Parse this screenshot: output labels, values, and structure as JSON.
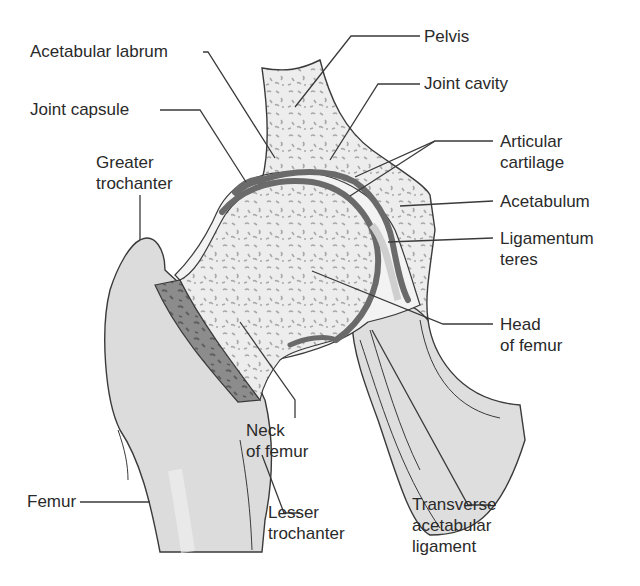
{
  "diagram": {
    "labels": {
      "acetabular_labrum": "Acetabular labrum",
      "joint_capsule": "Joint capsule",
      "greater_trochanter": [
        "Greater",
        "trochanter"
      ],
      "pelvis": "Pelvis",
      "joint_cavity": "Joint cavity",
      "articular_cartilage": [
        "Articular",
        "cartilage"
      ],
      "acetabulum": "Acetabulum",
      "ligamentum_teres": [
        "Ligamentum",
        "teres"
      ],
      "head_of_femur": [
        "Head",
        "of femur"
      ],
      "neck_of_femur": [
        "Neck",
        "of femur"
      ],
      "femur": "Femur",
      "lesser_trochanter": [
        "Lesser",
        "trochanter"
      ],
      "transverse_acetabular_ligament": [
        "Transverse",
        "acetabular",
        "ligament"
      ]
    },
    "colors": {
      "bone_fill": "#e4e4e4",
      "spongy_fill": "#ececec",
      "spongy_dots": "#a8a8a8",
      "cartilage": "#6a6a6a",
      "outline": "#3a3a3a",
      "leader": "#3a3a3a",
      "text": "#2a2a2a"
    }
  }
}
